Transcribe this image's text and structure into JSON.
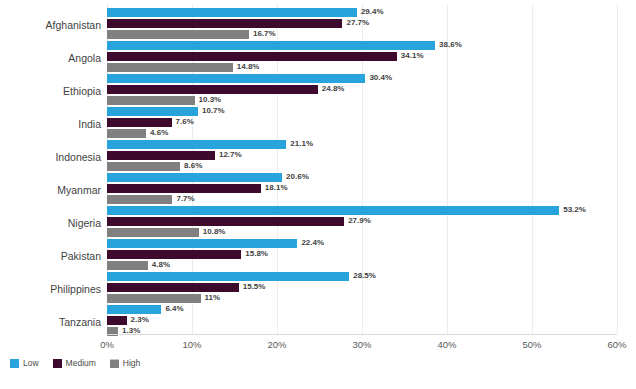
{
  "chart_data": {
    "type": "bar",
    "orientation": "horizontal",
    "title": "",
    "subtitle": "",
    "xlabel": "",
    "ylabel": "",
    "xlim": [
      0,
      60
    ],
    "xticks": [
      "0%",
      "10%",
      "20%",
      "30%",
      "40%",
      "50%",
      "60%"
    ],
    "xtick_values": [
      0,
      10,
      20,
      30,
      40,
      50,
      60
    ],
    "grid": true,
    "grid_axis": "x",
    "legend_position": "bottom-left",
    "value_labels": true,
    "value_label_suffix": "%",
    "categories": [
      "Afghanistan",
      "Angola",
      "Ethiopia",
      "India",
      "Indonesia",
      "Myanmar",
      "Nigeria",
      "Pakistan",
      "Philippines",
      "Tanzania"
    ],
    "series": [
      {
        "name": "Low",
        "color": "#29a3dc",
        "values": [
          29.4,
          38.6,
          30.4,
          10.7,
          21.1,
          20.6,
          53.2,
          22.4,
          28.5,
          6.4
        ],
        "labels": [
          "29.4%",
          "38.6%",
          "30.4%",
          "10.7%",
          "21.1%",
          "20.6%",
          "53.2%",
          "22.4%",
          "28.5%",
          "6.4%"
        ]
      },
      {
        "name": "Medium",
        "color": "#3d0a2e",
        "values": [
          27.7,
          34.1,
          24.8,
          7.6,
          12.7,
          18.1,
          27.9,
          15.8,
          15.5,
          2.3
        ],
        "labels": [
          "27.7%",
          "34.1%",
          "24.8%",
          "7.6%",
          "12.7%",
          "18.1%",
          "27.9%",
          "15.8%",
          "15.5%",
          "2.3%"
        ]
      },
      {
        "name": "High",
        "color": "#808080",
        "values": [
          16.7,
          14.8,
          10.3,
          4.6,
          8.6,
          7.7,
          10.8,
          4.8,
          11.0,
          1.3
        ],
        "labels": [
          "16.7%",
          "14.8%",
          "10.3%",
          "4.6%",
          "8.6%",
          "7.7%",
          "10.8%",
          "4.8%",
          "11%",
          "1.3%"
        ]
      }
    ]
  },
  "legend": {
    "items": [
      {
        "label": "Low",
        "color": "#29a3dc"
      },
      {
        "label": "Medium",
        "color": "#3d0a2e"
      },
      {
        "label": "High",
        "color": "#808080"
      }
    ]
  }
}
